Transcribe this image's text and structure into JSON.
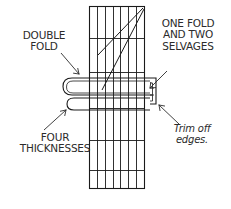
{
  "diagram": {
    "type": "line-drawing",
    "stroke_color": "#1a1a1a",
    "text_color": "#2b2b2b",
    "background_color": "#ffffff",
    "labels": {
      "double_fold": "DOUBLE\nFOLD",
      "one_fold_two_selvages": "ONE FOLD\nAND TWO\nSELVAGES",
      "four_thicknesses": "FOUR\nTHICKNESSES",
      "trim_off_edges": "Trim off\nedges."
    },
    "fabric_strip": {
      "left": 89,
      "right": 145,
      "top": 6,
      "bottom": 189,
      "vertical_grid_x": [
        97,
        105,
        113,
        120,
        128,
        136
      ],
      "horizontal_grid_y": [
        38,
        72,
        108,
        140,
        170
      ],
      "bias_lines": 2
    },
    "fold_roll": {
      "left": 62,
      "right": 162,
      "top": 77,
      "bottom": 115
    },
    "arrows": [
      {
        "name": "double-fold-arrow",
        "from": [
          62,
          52
        ],
        "to": [
          80,
          76
        ],
        "direction": "down-right"
      },
      {
        "name": "one-fold-arrow",
        "from": [
          166,
          72
        ],
        "to": [
          150,
          88
        ],
        "direction": "down-left"
      },
      {
        "name": "four-thicknesses-arrow",
        "from": [
          44,
          131
        ],
        "to": [
          68,
          110
        ],
        "direction": "up-right"
      },
      {
        "name": "trim-off-arrow",
        "from": [
          178,
          124
        ],
        "to": [
          158,
          106
        ],
        "direction": "up-left"
      }
    ]
  }
}
